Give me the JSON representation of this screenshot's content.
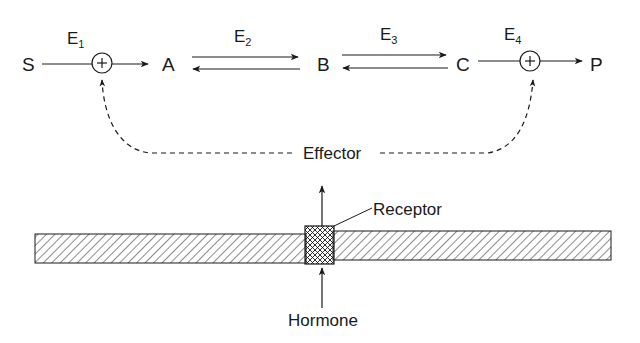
{
  "diagram": {
    "pathway": {
      "nodes": [
        "S",
        "A",
        "B",
        "C",
        "P"
      ],
      "enzymes": [
        {
          "label": "E",
          "sub": "1",
          "type": "irreversible",
          "regulated": true,
          "from": "S",
          "to": "A",
          "mark": "+"
        },
        {
          "label": "E",
          "sub": "2",
          "type": "reversible",
          "regulated": false,
          "from": "A",
          "to": "B"
        },
        {
          "label": "E",
          "sub": "3",
          "type": "reversible",
          "regulated": false,
          "from": "B",
          "to": "C"
        },
        {
          "label": "E",
          "sub": "4",
          "type": "irreversible",
          "regulated": true,
          "from": "C",
          "to": "P",
          "mark": "+"
        }
      ]
    },
    "effector": {
      "label": "Effector"
    },
    "membrane": {
      "receptor_label": "Receptor",
      "hormone_label": "Hormone"
    },
    "colors": {
      "ink": "#1a1a1a",
      "background": "#ffffff"
    }
  }
}
